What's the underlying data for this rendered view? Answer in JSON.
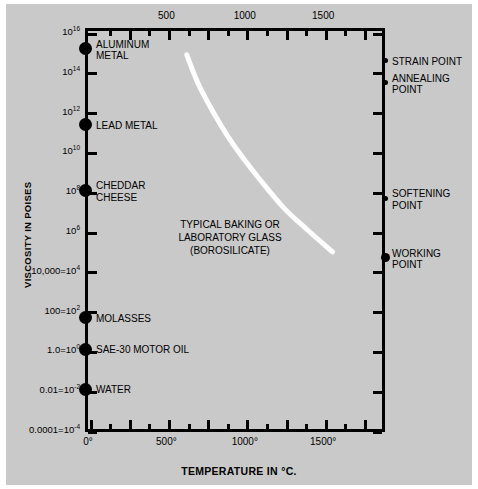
{
  "chart_data": {
    "type": "line",
    "title": "",
    "xlabel": "TEMPERATURE IN °C.",
    "ylabel": "VISCOSITY IN POISES",
    "xlim": [
      0,
      1875
    ],
    "ylim_log10": [
      -4,
      16
    ],
    "grid": false,
    "legend": "none",
    "x_axis_top": {
      "ticks": [
        250,
        500,
        750,
        1000,
        1250,
        1500,
        1750
      ],
      "labeled": [
        {
          "value": 500,
          "label": "500"
        },
        {
          "value": 1000,
          "label": "1000"
        },
        {
          "value": 1500,
          "label": "1500"
        }
      ]
    },
    "x_axis_bottom": {
      "ticks": [
        0,
        250,
        500,
        750,
        1000,
        1250,
        1500,
        1750
      ],
      "labeled": [
        {
          "value": 0,
          "label": "0°"
        },
        {
          "value": 500,
          "label": "500°"
        },
        {
          "value": 1000,
          "label": "1000°"
        },
        {
          "value": 1500,
          "label": "1500°"
        }
      ]
    },
    "y_axis": {
      "scale": "log10",
      "ticks_log10": [
        -4,
        -2,
        0,
        2,
        4,
        6,
        8,
        10,
        12,
        14,
        16
      ],
      "tick_labels": [
        {
          "exp": 16,
          "label": "10",
          "sup": "16"
        },
        {
          "exp": 14,
          "label": "10",
          "sup": "14"
        },
        {
          "exp": 12,
          "label": "10",
          "sup": "12"
        },
        {
          "exp": 10,
          "label": "10",
          "sup": "10"
        },
        {
          "exp": 8,
          "label": "10",
          "sup": "8"
        },
        {
          "exp": 6,
          "label": "10",
          "sup": "6"
        },
        {
          "exp": 4,
          "label": "10,000=10",
          "sup": "4"
        },
        {
          "exp": 2,
          "label": "100=10",
          "sup": "2"
        },
        {
          "exp": 0,
          "label": "1.0=10",
          "sup": "0"
        },
        {
          "exp": -2,
          "label": "0.01=10",
          "sup": "-2"
        },
        {
          "exp": -4,
          "label": "0.0001=10",
          "sup": "-4"
        }
      ]
    },
    "series": [
      {
        "name": "TYPICAL BAKING OR LABORATORY GLASS (BOROSILICATE)",
        "color": "#ffffff",
        "points": [
          {
            "x": 630,
            "y_log10": 14.8
          },
          {
            "x": 700,
            "y_log10": 13.4
          },
          {
            "x": 800,
            "y_log10": 11.9
          },
          {
            "x": 900,
            "y_log10": 10.6
          },
          {
            "x": 1000,
            "y_log10": 9.5
          },
          {
            "x": 1100,
            "y_log10": 8.5
          },
          {
            "x": 1250,
            "y_log10": 7.1
          },
          {
            "x": 1400,
            "y_log10": 6.0
          },
          {
            "x": 1560,
            "y_log10": 4.9
          }
        ]
      }
    ],
    "annotation": {
      "lines": [
        "TYPICAL BAKING OR",
        "LABORATORY GLASS",
        "(BOROSILICATE)"
      ]
    },
    "left_markers": [
      {
        "label": "ALUMINUM\nMETAL",
        "y_log10": 15.1,
        "marker": "big-dot"
      },
      {
        "label": "LEAD METAL",
        "y_log10": 11.3,
        "marker": "big-dot"
      },
      {
        "label": "CHEDDAR\nCHEESE",
        "y_log10": 8.0,
        "marker": "big-dot"
      },
      {
        "label": "MOLASSES",
        "y_log10": 1.6,
        "marker": "big-dot"
      },
      {
        "label": "SAE-30 MOTOR OIL",
        "y_log10": 0.0,
        "marker": "big-dot"
      },
      {
        "label": "WATER",
        "y_log10": -2.0,
        "marker": "big-dot"
      }
    ],
    "right_markers": [
      {
        "label": "STRAIN POINT",
        "y_log10": 14.5,
        "marker": "small-dot"
      },
      {
        "label": "ANNEALING\nPOINT",
        "y_log10": 13.4,
        "marker": "small-dot"
      },
      {
        "label": "SOFTENING\nPOINT",
        "y_log10": 7.6,
        "marker": "small-dot"
      },
      {
        "label": "WORKING\nPOINT",
        "y_log10": 4.6,
        "marker": "med-dot"
      }
    ],
    "colors": {
      "background": "#c9c9c9",
      "axis": "#000000",
      "curve": "#ffffff",
      "text": "#000000"
    }
  }
}
